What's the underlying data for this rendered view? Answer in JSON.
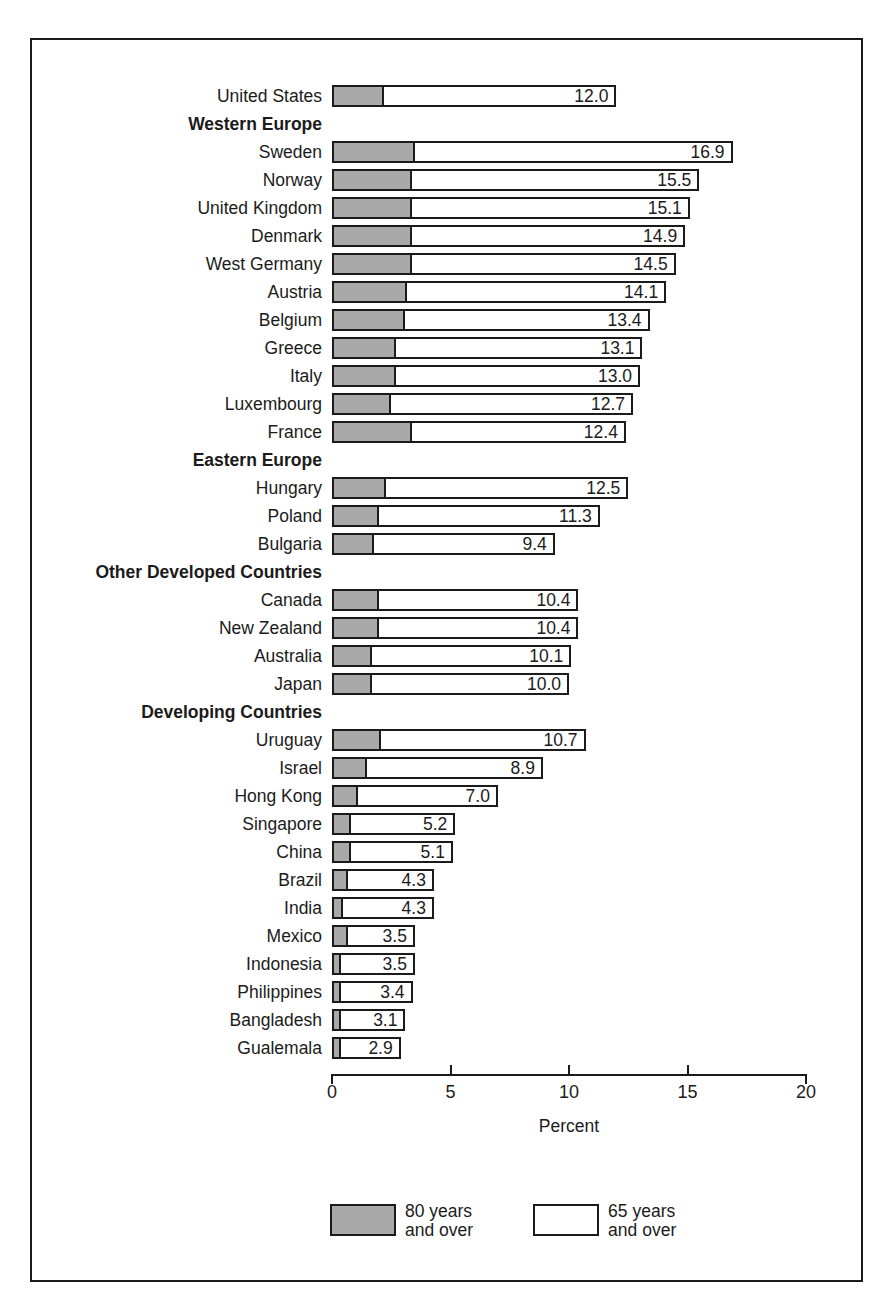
{
  "chart_data": {
    "type": "bar",
    "orientation": "horizontal",
    "stacked": true,
    "title": "",
    "xlabel": "Percent",
    "ylabel": "",
    "xlim": [
      0,
      20
    ],
    "xticks": [
      0,
      5,
      10,
      15,
      20
    ],
    "xtick_labels": [
      "0",
      "5",
      "10",
      "15",
      "20"
    ],
    "grid": false,
    "legend_position": "bottom",
    "series": [
      {
        "name": "80 years and over",
        "key": "v80",
        "color": "#a9a9a9"
      },
      {
        "name": "65 years and over",
        "key": "v65",
        "color": "#ffffff"
      }
    ],
    "rows": [
      {
        "label": "United States",
        "type": "country",
        "v65": 12.0,
        "v80": 2.1,
        "value_label": "12.0"
      },
      {
        "label": "Western Europe",
        "type": "group"
      },
      {
        "label": "Sweden",
        "type": "country",
        "v65": 16.9,
        "v80": 3.4,
        "value_label": "16.9"
      },
      {
        "label": "Norway",
        "type": "country",
        "v65": 15.5,
        "v80": 3.3,
        "value_label": "15.5"
      },
      {
        "label": "United Kingdom",
        "type": "country",
        "v65": 15.1,
        "v80": 3.3,
        "value_label": "15.1"
      },
      {
        "label": "Denmark",
        "type": "country",
        "v65": 14.9,
        "v80": 3.3,
        "value_label": "14.9"
      },
      {
        "label": "West Germany",
        "type": "country",
        "v65": 14.5,
        "v80": 3.3,
        "value_label": "14.5"
      },
      {
        "label": "Austria",
        "type": "country",
        "v65": 14.1,
        "v80": 3.1,
        "value_label": "14.1"
      },
      {
        "label": "Belgium",
        "type": "country",
        "v65": 13.4,
        "v80": 3.0,
        "value_label": "13.4"
      },
      {
        "label": "Greece",
        "type": "country",
        "v65": 13.1,
        "v80": 2.6,
        "value_label": "13.1"
      },
      {
        "label": "Italy",
        "type": "country",
        "v65": 13.0,
        "v80": 2.6,
        "value_label": "13.0"
      },
      {
        "label": "Luxembourg",
        "type": "country",
        "v65": 12.7,
        "v80": 2.4,
        "value_label": "12.7"
      },
      {
        "label": "France",
        "type": "country",
        "v65": 12.4,
        "v80": 3.3,
        "value_label": "12.4"
      },
      {
        "label": "Eastern Europe",
        "type": "group"
      },
      {
        "label": "Hungary",
        "type": "country",
        "v65": 12.5,
        "v80": 2.2,
        "value_label": "12.5"
      },
      {
        "label": "Poland",
        "type": "country",
        "v65": 11.3,
        "v80": 1.9,
        "value_label": "11.3"
      },
      {
        "label": "Bulgaria",
        "type": "country",
        "v65": 9.4,
        "v80": 1.7,
        "value_label": "9.4"
      },
      {
        "label": "Other Developed Countries",
        "type": "group"
      },
      {
        "label": "Canada",
        "type": "country",
        "v65": 10.4,
        "v80": 1.9,
        "value_label": "10.4"
      },
      {
        "label": "New Zealand",
        "type": "country",
        "v65": 10.4,
        "v80": 1.9,
        "value_label": "10.4"
      },
      {
        "label": "Australia",
        "type": "country",
        "v65": 10.1,
        "v80": 1.6,
        "value_label": "10.1"
      },
      {
        "label": "Japan",
        "type": "country",
        "v65": 10.0,
        "v80": 1.6,
        "value_label": "10.0"
      },
      {
        "label": "Developing Countries",
        "type": "group"
      },
      {
        "label": "Uruguay",
        "type": "country",
        "v65": 10.7,
        "v80": 2.0,
        "value_label": "10.7"
      },
      {
        "label": "Israel",
        "type": "country",
        "v65": 8.9,
        "v80": 1.4,
        "value_label": "8.9"
      },
      {
        "label": "Hong Kong",
        "type": "country",
        "v65": 7.0,
        "v80": 1.0,
        "value_label": "7.0"
      },
      {
        "label": "Singapore",
        "type": "country",
        "v65": 5.2,
        "v80": 0.7,
        "value_label": "5.2"
      },
      {
        "label": "China",
        "type": "country",
        "v65": 5.1,
        "v80": 0.7,
        "value_label": "5.1"
      },
      {
        "label": "Brazil",
        "type": "country",
        "v65": 4.3,
        "v80": 0.6,
        "value_label": "4.3"
      },
      {
        "label": "India",
        "type": "country",
        "v65": 4.3,
        "v80": 0.4,
        "value_label": "4.3"
      },
      {
        "label": "Mexico",
        "type": "country",
        "v65": 3.5,
        "v80": 0.6,
        "value_label": "3.5"
      },
      {
        "label": "Indonesia",
        "type": "country",
        "v65": 3.5,
        "v80": 0.3,
        "value_label": "3.5"
      },
      {
        "label": "Philippines",
        "type": "country",
        "v65": 3.4,
        "v80": 0.3,
        "value_label": "3.4"
      },
      {
        "label": "Bangladesh",
        "type": "country",
        "v65": 3.1,
        "v80": 0.3,
        "value_label": "3.1"
      },
      {
        "label": "Gualemala",
        "type": "country",
        "v65": 2.9,
        "v80": 0.3,
        "value_label": "2.9"
      }
    ]
  },
  "axis": {
    "title": "Percent",
    "ticks": [
      "0",
      "5",
      "10",
      "15",
      "20"
    ]
  },
  "legend": {
    "items": [
      {
        "swatch": "filled",
        "label": "80 years\nand over"
      },
      {
        "swatch": "empty",
        "label": "65 years\nand over"
      }
    ]
  },
  "colors": {
    "ink": "#1b1b1b",
    "fill_80": "#a9a9a9",
    "fill_65": "#ffffff",
    "background": "#ffffff"
  }
}
